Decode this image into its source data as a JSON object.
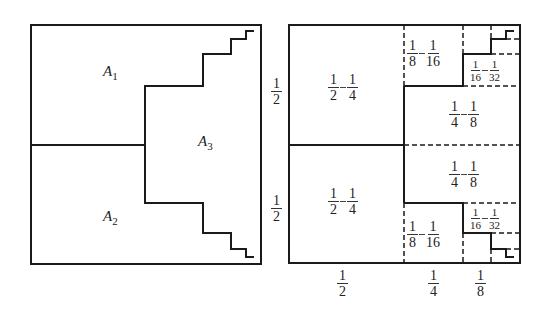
{
  "left_diagram": {
    "regions": [
      {
        "name": "A",
        "sub": "1"
      },
      {
        "name": "A",
        "sub": "2"
      },
      {
        "name": "A",
        "sub": "3"
      }
    ]
  },
  "right_diagram": {
    "side_labels": [
      {
        "num": "1",
        "den": "2"
      },
      {
        "num": "1",
        "den": "2"
      }
    ],
    "bottom_labels": [
      {
        "num": "1",
        "den": "2"
      },
      {
        "num": "1",
        "den": "4"
      },
      {
        "num": "1",
        "den": "8"
      }
    ],
    "cells": [
      {
        "a": {
          "num": "1",
          "den": "2"
        },
        "b": {
          "num": "1",
          "den": "4"
        }
      },
      {
        "a": {
          "num": "1",
          "den": "2"
        },
        "b": {
          "num": "1",
          "den": "4"
        }
      },
      {
        "a": {
          "num": "1",
          "den": "8"
        },
        "b": {
          "num": "1",
          "den": "16"
        }
      },
      {
        "a": {
          "num": "1",
          "den": "16"
        },
        "b": {
          "num": "1",
          "den": "32"
        }
      },
      {
        "a": {
          "num": "1",
          "den": "4"
        },
        "b": {
          "num": "1",
          "den": "8"
        }
      },
      {
        "a": {
          "num": "1",
          "den": "4"
        },
        "b": {
          "num": "1",
          "den": "8"
        }
      },
      {
        "a": {
          "num": "1",
          "den": "8"
        },
        "b": {
          "num": "1",
          "den": "16"
        }
      },
      {
        "a": {
          "num": "1",
          "den": "16"
        },
        "b": {
          "num": "1",
          "den": "32"
        }
      }
    ]
  }
}
